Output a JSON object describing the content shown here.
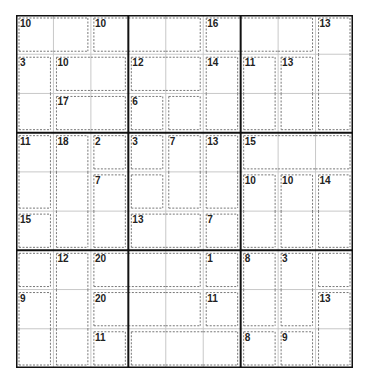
{
  "puzzle": {
    "type": "Killer Sudoku",
    "size": 9,
    "colors": {
      "thin_line": "#c8c8c8",
      "thick_line": "#111111",
      "cage_line": "#777777",
      "label": "#222222"
    },
    "cages": [
      {
        "sum": "10",
        "cells": [
          [
            0,
            0
          ],
          [
            0,
            1
          ]
        ]
      },
      {
        "sum": "10",
        "cells": [
          [
            0,
            2
          ],
          [
            0,
            3
          ],
          [
            0,
            4
          ]
        ]
      },
      {
        "sum": "16",
        "cells": [
          [
            0,
            5
          ],
          [
            0,
            6
          ],
          [
            0,
            7
          ]
        ]
      },
      {
        "sum": "13",
        "cells": [
          [
            0,
            8
          ],
          [
            1,
            8
          ],
          [
            2,
            8
          ]
        ]
      },
      {
        "sum": "3",
        "cells": [
          [
            1,
            0
          ],
          [
            2,
            0
          ]
        ]
      },
      {
        "sum": "10",
        "cells": [
          [
            1,
            1
          ],
          [
            1,
            2
          ]
        ]
      },
      {
        "sum": "12",
        "cells": [
          [
            1,
            3
          ],
          [
            1,
            4
          ]
        ]
      },
      {
        "sum": "14",
        "cells": [
          [
            1,
            5
          ],
          [
            2,
            5
          ]
        ]
      },
      {
        "sum": "11",
        "cells": [
          [
            1,
            6
          ],
          [
            2,
            6
          ]
        ]
      },
      {
        "sum": "13",
        "cells": [
          [
            1,
            7
          ],
          [
            2,
            7
          ]
        ]
      },
      {
        "sum": "17",
        "cells": [
          [
            2,
            1
          ],
          [
            2,
            2
          ]
        ]
      },
      {
        "sum": "6",
        "cells": [
          [
            2,
            3
          ]
        ]
      },
      {
        "sum": "",
        "cells": [
          [
            2,
            4
          ]
        ]
      },
      {
        "sum": "11",
        "cells": [
          [
            3,
            0
          ],
          [
            4,
            0
          ]
        ]
      },
      {
        "sum": "18",
        "cells": [
          [
            3,
            1
          ],
          [
            4,
            1
          ],
          [
            5,
            1
          ]
        ]
      },
      {
        "sum": "2",
        "cells": [
          [
            3,
            2
          ]
        ]
      },
      {
        "sum": "3",
        "cells": [
          [
            3,
            3
          ]
        ]
      },
      {
        "sum": "7",
        "cells": [
          [
            3,
            4
          ],
          [
            4,
            4
          ]
        ]
      },
      {
        "sum": "13",
        "cells": [
          [
            3,
            5
          ],
          [
            4,
            5
          ]
        ]
      },
      {
        "sum": "15",
        "cells": [
          [
            3,
            6
          ],
          [
            3,
            7
          ],
          [
            3,
            8
          ]
        ]
      },
      {
        "sum": "7",
        "cells": [
          [
            4,
            2
          ],
          [
            5,
            2
          ]
        ]
      },
      {
        "sum": "",
        "cells": [
          [
            4,
            3
          ]
        ]
      },
      {
        "sum": "10",
        "cells": [
          [
            4,
            6
          ],
          [
            5,
            6
          ]
        ]
      },
      {
        "sum": "10",
        "cells": [
          [
            4,
            7
          ],
          [
            5,
            7
          ]
        ]
      },
      {
        "sum": "14",
        "cells": [
          [
            4,
            8
          ],
          [
            5,
            8
          ]
        ]
      },
      {
        "sum": "15",
        "cells": [
          [
            5,
            0
          ]
        ]
      },
      {
        "sum": "13",
        "cells": [
          [
            5,
            3
          ],
          [
            5,
            4
          ]
        ]
      },
      {
        "sum": "7",
        "cells": [
          [
            5,
            5
          ]
        ]
      },
      {
        "sum": "",
        "cells": [
          [
            6,
            0
          ]
        ]
      },
      {
        "sum": "12",
        "cells": [
          [
            6,
            1
          ],
          [
            7,
            1
          ],
          [
            8,
            1
          ]
        ]
      },
      {
        "sum": "20",
        "cells": [
          [
            6,
            2
          ],
          [
            6,
            3
          ],
          [
            6,
            4
          ]
        ]
      },
      {
        "sum": "1",
        "cells": [
          [
            6,
            5
          ]
        ]
      },
      {
        "sum": "8",
        "cells": [
          [
            6,
            6
          ],
          [
            7,
            6
          ]
        ]
      },
      {
        "sum": "3",
        "cells": [
          [
            6,
            7
          ],
          [
            7,
            7
          ]
        ]
      },
      {
        "sum": "",
        "cells": [
          [
            6,
            8
          ]
        ]
      },
      {
        "sum": "9",
        "cells": [
          [
            7,
            0
          ],
          [
            8,
            0
          ]
        ]
      },
      {
        "sum": "20",
        "cells": [
          [
            7,
            2
          ],
          [
            7,
            3
          ],
          [
            7,
            4
          ]
        ]
      },
      {
        "sum": "11",
        "cells": [
          [
            7,
            5
          ]
        ]
      },
      {
        "sum": "13",
        "cells": [
          [
            7,
            8
          ],
          [
            8,
            8
          ]
        ]
      },
      {
        "sum": "11",
        "cells": [
          [
            8,
            2
          ]
        ]
      },
      {
        "sum": "",
        "cells": [
          [
            8,
            3
          ],
          [
            8,
            4
          ],
          [
            8,
            5
          ]
        ]
      },
      {
        "sum": "8",
        "cells": [
          [
            8,
            6
          ]
        ]
      },
      {
        "sum": "9",
        "cells": [
          [
            8,
            7
          ]
        ]
      }
    ]
  }
}
